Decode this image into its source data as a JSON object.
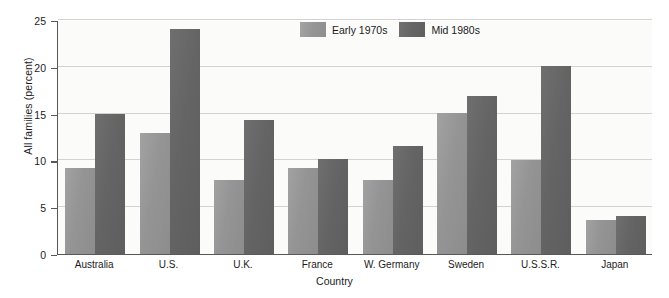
{
  "chart_data": {
    "type": "bar",
    "title": "",
    "xlabel": "Country",
    "ylabel": "All families (percent)",
    "categories": [
      "Australia",
      "U.S.",
      "U.K.",
      "France",
      "W. Germany",
      "Sweden",
      "U.S.S.R.",
      "Japan"
    ],
    "series": [
      {
        "name": "Early 1970s",
        "color": "#959595",
        "values": [
          9.2,
          12.9,
          7.9,
          9.2,
          7.9,
          15.1,
          10.0,
          3.6
        ]
      },
      {
        "name": "Mid 1980s",
        "color": "#656565",
        "values": [
          15.0,
          24.0,
          14.3,
          10.1,
          11.5,
          16.9,
          20.1,
          4.1
        ]
      }
    ],
    "ylim": [
      0,
      25
    ],
    "yticks": [
      0,
      5,
      10,
      15,
      20,
      25
    ],
    "ytick_labels": [
      "0",
      "5",
      "10",
      "15",
      "20",
      "25"
    ],
    "grid": true,
    "legend_position": "top-center",
    "plot_background": "#fbfbf9",
    "axis_color": "#58585a",
    "gridline_color": "#d2d2d0"
  }
}
